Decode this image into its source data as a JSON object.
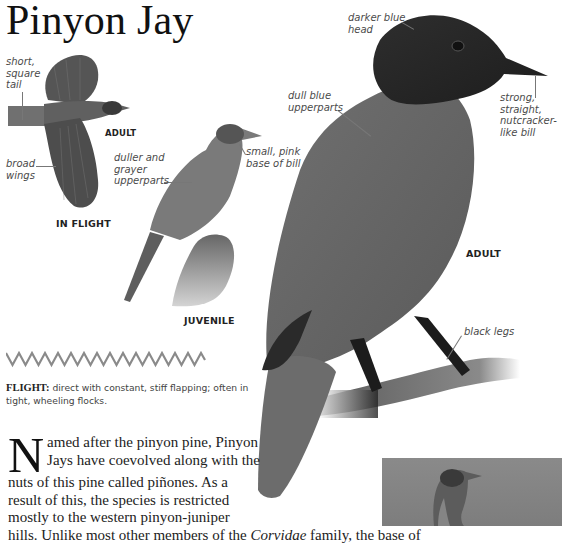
{
  "page": {
    "title": "Pinyon Jay"
  },
  "illustrations": {
    "in_flight": {
      "label": "IN FLIGHT",
      "age_label": "ADULT",
      "annotations": {
        "tail": "short,\nsquare\ntail",
        "wings": "broad\nwings"
      }
    },
    "juvenile": {
      "label": "JUVENILE",
      "annotations": {
        "upperparts": "duller and\ngrayer\nupperparts",
        "bill": "small, pink\nbase of bill"
      }
    },
    "adult": {
      "label": "ADULT",
      "annotations": {
        "head": "darker blue\nhead",
        "upperparts": "dull blue\nupperparts",
        "bill": "strong,\nstraight,\nnutcracker-\nlike bill",
        "legs": "black legs"
      }
    }
  },
  "flight": {
    "heading": "FLIGHT:",
    "description": " direct with constant, stiff flapping; often in tight, wheeling flocks."
  },
  "body": {
    "dropcap": "N",
    "lines": [
      "amed after the pinyon pine, Pinyon",
      "Jays have coevolved along with the",
      "nuts of this pine called piñones. As a",
      "result of this, the species is restricted",
      "mostly to the western pinyon-juniper"
    ],
    "last_line_prefix": "hills. Unlike most other members of the ",
    "last_line_italic": "Corvidae",
    "last_line_suffix": " family, the base of"
  },
  "colors": {
    "text": "#1a1a1a",
    "annotation": "#4a4a4a",
    "bird_dark": "#2a2a2a",
    "bird_mid": "#6b6b6b",
    "photo_bg": "#868686"
  }
}
